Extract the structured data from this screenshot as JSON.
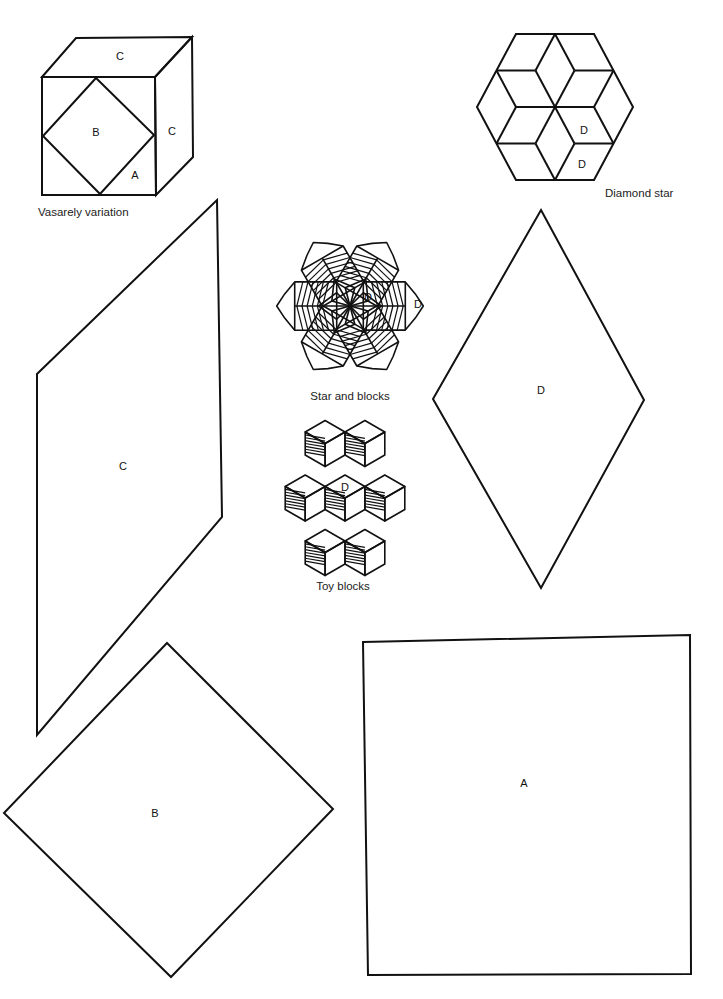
{
  "page": {
    "background": "#ffffff",
    "ink": "#111111"
  },
  "figures": {
    "vasarely": {
      "caption": "Vasarely variation",
      "labels": {
        "top": "C",
        "center": "B",
        "side": "C",
        "corner": "A"
      }
    },
    "diamond_star": {
      "caption": "Diamond star",
      "labels": {
        "inner": "D",
        "outer": "D"
      }
    },
    "star_blocks": {
      "caption": "Star and blocks",
      "labels": {
        "inner": "D",
        "cap": "D"
      }
    },
    "toy_blocks": {
      "caption": "Toy blocks",
      "labels": {
        "center": "D"
      }
    }
  },
  "templates": {
    "parallelogram_c": {
      "label": "C"
    },
    "diamond_d": {
      "label": "D"
    },
    "square_b": {
      "label": "B"
    },
    "square_a": {
      "label": "A"
    }
  }
}
